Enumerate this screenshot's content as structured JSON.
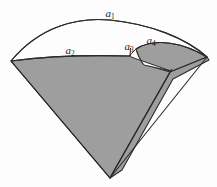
{
  "figure": {
    "width": 217,
    "height": 187,
    "background_color": "#fdfdfd",
    "fill_color": "#9e9e9e",
    "stroke_color": "#2b2b2b",
    "white_region_color": "#fdfdfd"
  },
  "labels": [
    {
      "id": "a1",
      "base": "a",
      "sub": "1",
      "text": "a1",
      "x": 110,
      "y": 13
    },
    {
      "id": "a2",
      "base": "a",
      "sub": "2",
      "text": "a2",
      "x": 70,
      "y": 50
    },
    {
      "id": "a3",
      "base": "a",
      "sub": "3",
      "text": "a3",
      "x": 129,
      "y": 46
    },
    {
      "id": "a4",
      "base": "a",
      "sub": "4",
      "text": "a4",
      "x": 151,
      "y": 40
    }
  ],
  "geometry": {
    "apex": {
      "x": 110,
      "y": 178
    },
    "left_vertex": {
      "x": 11,
      "y": 61
    },
    "right_vertex": {
      "x": 207,
      "y": 57
    },
    "inner_apex": {
      "x": 170,
      "y": 72
    },
    "outer_arc_peak": {
      "x": 110,
      "y": 20
    },
    "notch_x": 130,
    "notch_y": 55
  },
  "chart_data": {
    "type": "diagram",
    "regions": [
      {
        "label": "a1",
        "description": "outer arc of the large white crescent"
      },
      {
        "label": "a2",
        "description": "inner arc bounding the shaded sector on the left"
      },
      {
        "label": "a3",
        "description": "short arc at the notch between the two sectors"
      },
      {
        "label": "a4",
        "description": "arc of the smaller overlapping shaded lobe"
      }
    ]
  }
}
